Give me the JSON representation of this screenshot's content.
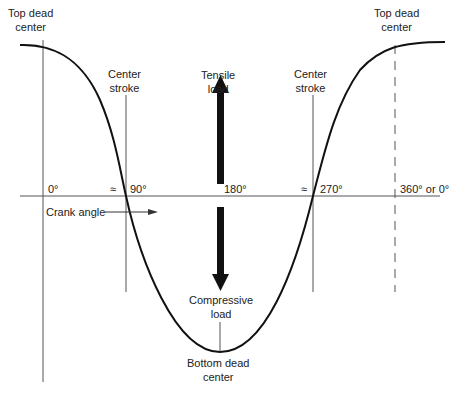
{
  "diagram": {
    "labels": {
      "top_dead_center_left": [
        "Top dead",
        "center"
      ],
      "top_dead_center_right": [
        "Top dead",
        "center"
      ],
      "center_stroke_left": [
        "Center",
        "stroke"
      ],
      "center_stroke_right": [
        "Center",
        "stroke"
      ],
      "tensile_load": [
        "Tensile",
        "load"
      ],
      "compressive_load": [
        "Compressive",
        "load"
      ],
      "bottom_dead_center": [
        "Bottom dead",
        "center"
      ],
      "crank_angle": "Crank angle"
    },
    "angles": {
      "a0": "0°",
      "approx1": "≈",
      "a90": "90°",
      "a180": "180°",
      "approx2": "≈",
      "a270": "270°",
      "a360": "360° or 0°"
    },
    "colors": {
      "curve": "#111111",
      "lines": "#555555",
      "arrows": "#111111"
    }
  }
}
